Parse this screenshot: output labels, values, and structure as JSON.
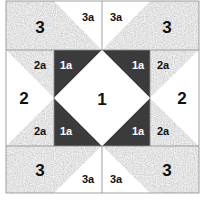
{
  "diagram": {
    "title": "",
    "type": "quilt-block",
    "colors": {
      "background": "#ffffff",
      "light": "#ffffff",
      "medium_speckle": "#bdbdbd",
      "dark": "#3b3b3b",
      "outline": "#8a8a8a"
    },
    "pieces": {
      "center": {
        "label": "1"
      },
      "center_corners": [
        {
          "position": "top-left",
          "label": "1a"
        },
        {
          "position": "top-right",
          "label": "1a"
        },
        {
          "position": "bottom-left",
          "label": "1a"
        },
        {
          "position": "bottom-right",
          "label": "1a"
        }
      ],
      "side_left": {
        "label": "2"
      },
      "side_right": {
        "label": "2"
      },
      "side_corners": [
        {
          "position": "left-top",
          "label": "2a"
        },
        {
          "position": "left-bottom",
          "label": "2a"
        },
        {
          "position": "right-top",
          "label": "2a"
        },
        {
          "position": "right-bottom",
          "label": "2a"
        }
      ],
      "corner_units": [
        {
          "position": "top-left",
          "label": "3"
        },
        {
          "position": "top-right",
          "label": "3"
        },
        {
          "position": "bottom-left",
          "label": "3"
        },
        {
          "position": "bottom-right",
          "label": "3"
        }
      ],
      "corner_triangles": [
        {
          "position": "top-left",
          "label": "3a"
        },
        {
          "position": "top-right",
          "label": "3a"
        },
        {
          "position": "bottom-left",
          "label": "3a"
        },
        {
          "position": "bottom-right",
          "label": "3a"
        }
      ]
    }
  }
}
